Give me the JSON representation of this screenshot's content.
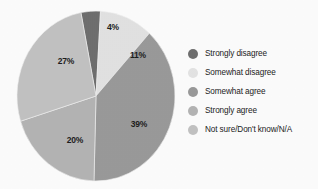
{
  "chart_data": {
    "type": "pie",
    "title": "",
    "labels": [
      "Strongly disagree",
      "Somewhat disagree",
      "Somewhat agree",
      "Strongly agree",
      "Not sure/Don't know/N/A"
    ],
    "values": [
      4,
      11,
      39,
      20,
      27
    ],
    "data_labels": [
      "4%",
      "11%",
      "39%",
      "20%",
      "27%"
    ],
    "colors": [
      "#6f6f6f",
      "#e2e2e2",
      "#9a9a9a",
      "#b4b4b4",
      "#c2c2c2"
    ],
    "units": "percent",
    "start_angle_deg": -11,
    "direction": "clockwise",
    "legend_position": "right",
    "grid": false
  },
  "slices": [
    {
      "id": "strongly-disagree",
      "label": "Strongly disagree",
      "value": 4,
      "data_label": "4%",
      "color": "#6f6f6f",
      "label_x": 103,
      "label_y": 21
    },
    {
      "id": "somewhat-disagree",
      "label": "Somewhat disagree",
      "value": 11,
      "data_label": "11%",
      "color": "#e2e2e2",
      "label_x": 128,
      "label_y": 49
    },
    {
      "id": "somewhat-agree",
      "label": "Somewhat agree",
      "value": 39,
      "data_label": "39%",
      "color": "#9a9a9a",
      "label_x": 129,
      "label_y": 118
    },
    {
      "id": "strongly-agree",
      "label": "Strongly agree",
      "value": 20,
      "data_label": "20%",
      "color": "#b4b4b4",
      "label_x": 65,
      "label_y": 134
    },
    {
      "id": "not-sure",
      "label": "Not sure/Don't know/N/A",
      "value": 27,
      "data_label": "27%",
      "color": "#c2c2c2",
      "label_x": 56,
      "label_y": 55
    }
  ],
  "legend": {
    "items": [
      {
        "label": "Strongly disagree",
        "color": "#6f6f6f"
      },
      {
        "label": "Somewhat disagree",
        "color": "#e4e4e4"
      },
      {
        "label": "Somewhat agree",
        "color": "#9a9a9a"
      },
      {
        "label": "Strongly agree",
        "color": "#b4b4b4"
      },
      {
        "label": "Not sure/Don't know/N/A",
        "color": "#c2c2c2"
      }
    ]
  }
}
